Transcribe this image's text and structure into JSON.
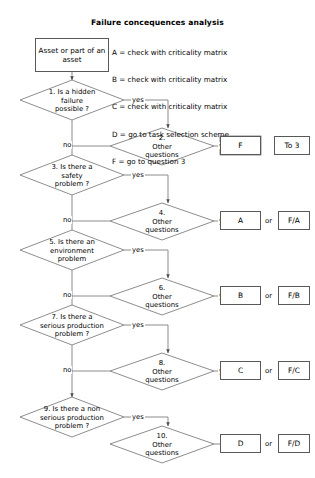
{
  "title": "Failure concequences analysis",
  "legend": [
    "A = check with criticality matrix",
    "B = check with criticality matrix",
    "C = check with criticality matrix",
    "D = go to task selection scheme",
    "F = go to question 3"
  ],
  "start": {
    "label": "Asset or part\nof an asset"
  },
  "edge_labels": {
    "yes": "yes",
    "no": "no",
    "or": "or"
  },
  "rows": [
    {
      "question": {
        "id": "q1",
        "number": "1.",
        "text": "1. Is a hidden\nfailure\npossible ?",
        "yes_label": "yes",
        "no_label": "no"
      },
      "other": {
        "id": "q2",
        "text": "2.\nOther\nquestions",
        "exit_label": "yes"
      },
      "results": [
        {
          "label": "F"
        },
        {
          "label": "To 3"
        }
      ],
      "separator": ""
    },
    {
      "question": {
        "id": "q3",
        "number": "3.",
        "text": "3. Is there a\nsafety\nproblem ?",
        "yes_label": "yes",
        "no_label": "no"
      },
      "other": {
        "id": "q4",
        "text": "4.\nOther\nquestions",
        "exit_label": "yes"
      },
      "results": [
        {
          "label": "A"
        },
        {
          "label": "F/A"
        }
      ],
      "separator": "or"
    },
    {
      "question": {
        "id": "q5",
        "number": "5.",
        "text": "5. Is there an\nenvironment\nproblem",
        "yes_label": "yes",
        "no_label": "no"
      },
      "other": {
        "id": "q6",
        "text": "6.\nOther\nquestions",
        "exit_label": "yes"
      },
      "results": [
        {
          "label": "B"
        },
        {
          "label": "F/B"
        }
      ],
      "separator": "or"
    },
    {
      "question": {
        "id": "q7",
        "number": "7.",
        "text": "7. Is there a\nserious production\nproblem ?",
        "yes_label": "yes",
        "no_label": "no"
      },
      "other": {
        "id": "q8",
        "text": "8.\nOther\nquestions",
        "exit_label": "yes"
      },
      "results": [
        {
          "label": "C"
        },
        {
          "label": "F/C"
        }
      ],
      "separator": "or"
    },
    {
      "question": {
        "id": "q9",
        "number": "9.",
        "text": "9. Is there a non\nserious production\nproblem ?",
        "yes_label": "yes",
        "no_label": "no"
      },
      "other": {
        "id": "q10",
        "text": "10.\nOther\nquestions",
        "exit_label": "no"
      },
      "results": [
        {
          "label": "D"
        },
        {
          "label": "F/D"
        }
      ],
      "separator": "or"
    }
  ],
  "colors": {
    "stroke": "#808080",
    "box_border": "#595959",
    "text": "#000000",
    "background": "#ffffff"
  }
}
